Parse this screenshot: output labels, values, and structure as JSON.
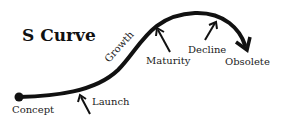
{
  "title": "S Curve",
  "stages": {
    "concept": "Concept",
    "launch": "Launch",
    "growth": "Growth",
    "maturity": "Maturity",
    "decline": "Decline",
    "obsolete": "Obsolete"
  },
  "colors": {
    "ink": "#111111",
    "background": "#ffffff"
  }
}
